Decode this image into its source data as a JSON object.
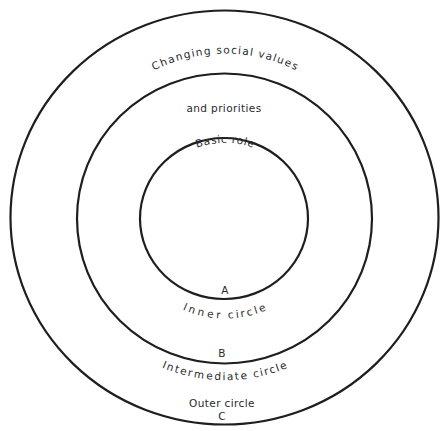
{
  "diagram": {
    "type": "concentric-circles",
    "outer": {
      "top_label": "Major social problems",
      "bottom_label": "Outer circle",
      "letter": "C"
    },
    "intermediate": {
      "top_label_line1": "Changing social values",
      "top_label_line2": "and priorities",
      "bottom_label": "Intermediate circle",
      "letter": "B"
    },
    "inner": {
      "top_label": "Basic role",
      "bottom_label": "Inner circle",
      "letter": "A"
    }
  }
}
